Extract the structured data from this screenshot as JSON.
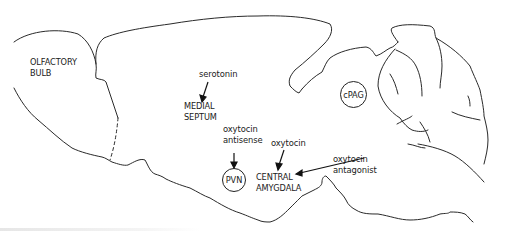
{
  "figure": {
    "type": "sagittal rat brain schematic",
    "regions": {
      "olfactory_bulb": [
        "OLFACTORY",
        "BULB"
      ],
      "medial_septum": [
        "MEDIAL",
        "SEPTUM"
      ],
      "cpag": "cPAG",
      "pvn": "PVN",
      "central_amygdala": [
        "CENTRAL",
        "AMYGDALA"
      ]
    },
    "treatments": {
      "serotonin": "serotonin",
      "oxytocin_antisense": [
        "oxytocin",
        "antisense"
      ],
      "oxytocin": "oxytocin",
      "oxytocin_antagonist": [
        "oxytocin",
        "antagonist"
      ]
    },
    "colors": {
      "line": "#2a2a2a",
      "text": "#1a1a1a",
      "background": "#ffffff"
    }
  }
}
